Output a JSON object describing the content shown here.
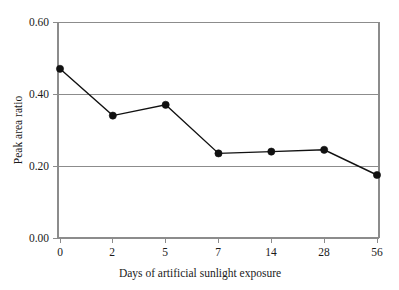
{
  "chart_data": {
    "type": "line",
    "title": "",
    "subtitle": "",
    "xlabel": "Days of artificial sunlight exposure",
    "ylabel": "Peak area ratio",
    "categories": [
      "0",
      "2",
      "5",
      "7",
      "14",
      "28",
      "56"
    ],
    "values": [
      0.47,
      0.34,
      0.37,
      0.235,
      0.24,
      0.245,
      0.175
    ],
    "series": [
      {
        "name": "Peak area ratio",
        "values": [
          0.47,
          0.34,
          0.37,
          0.235,
          0.24,
          0.245,
          0.175
        ]
      }
    ],
    "ylim": [
      0.0,
      0.6
    ],
    "ytick_labels": [
      "0.00",
      "0.20",
      "0.40",
      "0.60"
    ],
    "ytick_values": [
      0.0,
      0.2,
      0.4,
      0.6
    ],
    "xtick_labels": [
      "0",
      "2",
      "5",
      "7",
      "14",
      "28",
      "56"
    ],
    "grid": true,
    "grid_axis": "y",
    "legend": false,
    "legend_position": "none",
    "marker": "filled-circle",
    "line_color": "#111111",
    "marker_color": "#111111",
    "grid_color": "#8c8c8c",
    "axis_color": "#8c8c8c",
    "background_color": "#ffffff"
  },
  "axes": {
    "y": {
      "title": "Peak area ratio",
      "ticks": [
        {
          "label": "0.60",
          "value": 0.6
        },
        {
          "label": "0.40",
          "value": 0.4
        },
        {
          "label": "0.20",
          "value": 0.2
        },
        {
          "label": "0.00",
          "value": 0.0
        }
      ]
    },
    "x": {
      "title": "Days of artificial sunlight exposure",
      "ticks": [
        {
          "label": "0"
        },
        {
          "label": "2"
        },
        {
          "label": "5"
        },
        {
          "label": "7"
        },
        {
          "label": "14"
        },
        {
          "label": "28"
        },
        {
          "label": "56"
        }
      ]
    }
  }
}
